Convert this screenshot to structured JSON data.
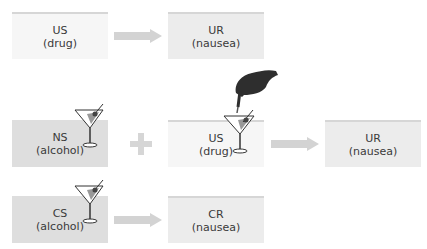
{
  "diagram": {
    "row1": {
      "stimulus": {
        "abbr": "US",
        "label": "(drug)"
      },
      "response": {
        "abbr": "UR",
        "label": "(nausea)"
      }
    },
    "row2": {
      "neutral": {
        "abbr": "NS",
        "label": "(alcohol)"
      },
      "operator": "+",
      "stimulus": {
        "abbr": "US",
        "label": "(drug)"
      },
      "response": {
        "abbr": "UR",
        "label": "(nausea)"
      }
    },
    "row3": {
      "conditioned": {
        "abbr": "CS",
        "label": "(alcohol)"
      },
      "response": {
        "abbr": "CR",
        "label": "(nausea)"
      }
    },
    "colors": {
      "box_light": "#f6f6f6",
      "box_gray": "#dedede",
      "arrow": "#d3d3d3",
      "text": "#3a3a3a"
    },
    "icons": [
      "martini-glass-icon",
      "hand-dropper-icon",
      "arrow-right-icon",
      "plus-icon"
    ]
  }
}
